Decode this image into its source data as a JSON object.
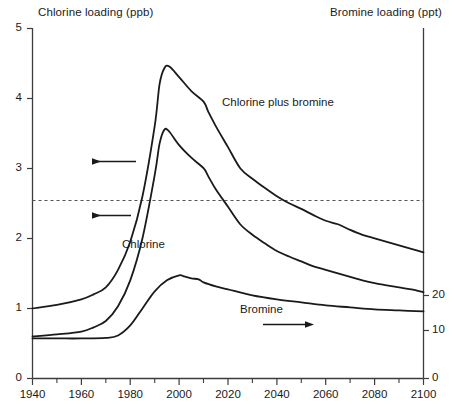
{
  "chart_data": {
    "type": "line",
    "title": "",
    "xlabel": "",
    "ylabel": "Chlorine loading (ppb)",
    "ylabel_right": "Bromine loading (ppt)",
    "xlim": [
      1940,
      2100
    ],
    "ylim": [
      0,
      5
    ],
    "ylim_right": [
      0,
      35
    ],
    "grid": false,
    "legend_position": "inline-annotations",
    "x_ticks": [
      1940,
      1960,
      1980,
      2000,
      2020,
      2040,
      2060,
      2080,
      2100
    ],
    "x_minor_ticks": [
      1950,
      1970,
      1990,
      2010,
      2030,
      2050,
      2070,
      2090
    ],
    "y_ticks_left": [
      0,
      1,
      2,
      3,
      4,
      5
    ],
    "y_ticks_right": [
      0,
      10,
      20
    ],
    "reference_line": {
      "label": "",
      "value": 2.47,
      "style": "dashed",
      "axis": "left"
    },
    "series": [
      {
        "name": "Chlorine plus bromine",
        "axis": "left",
        "units": "ppb",
        "x": [
          1940,
          1950,
          1960,
          1965,
          1970,
          1975,
          1980,
          1985,
          1990,
          1992,
          1994,
          1996,
          2000,
          2005,
          2010,
          2012,
          2015,
          2020,
          2025,
          2030,
          2035,
          2040,
          2045,
          2050,
          2055,
          2060,
          2065,
          2070,
          2075,
          2080,
          2085,
          2090,
          2095,
          2100
        ],
        "y": [
          1.0,
          1.05,
          1.13,
          1.2,
          1.3,
          1.55,
          1.95,
          2.6,
          3.6,
          4.2,
          4.43,
          4.45,
          4.3,
          4.1,
          3.95,
          3.8,
          3.6,
          3.3,
          3.0,
          2.85,
          2.72,
          2.6,
          2.5,
          2.42,
          2.33,
          2.25,
          2.2,
          2.12,
          2.05,
          2.0,
          1.95,
          1.9,
          1.85,
          1.8
        ]
      },
      {
        "name": "Chlorine",
        "axis": "left",
        "units": "ppb",
        "x": [
          1940,
          1950,
          1960,
          1965,
          1970,
          1975,
          1980,
          1985,
          1990,
          1992,
          1994,
          1996,
          2000,
          2005,
          2010,
          2012,
          2015,
          2020,
          2025,
          2030,
          2035,
          2040,
          2045,
          2050,
          2055,
          2060,
          2065,
          2070,
          2075,
          2080,
          2085,
          2090,
          2095,
          2100
        ],
        "y": [
          0.6,
          0.63,
          0.67,
          0.73,
          0.82,
          1.03,
          1.4,
          2.0,
          2.9,
          3.35,
          3.55,
          3.52,
          3.33,
          3.15,
          3.0,
          2.88,
          2.7,
          2.45,
          2.2,
          2.05,
          1.93,
          1.82,
          1.74,
          1.67,
          1.6,
          1.55,
          1.5,
          1.45,
          1.4,
          1.36,
          1.33,
          1.3,
          1.27,
          1.23
        ]
      },
      {
        "name": "Bromine",
        "axis": "right",
        "units": "ppt",
        "x": [
          1940,
          1950,
          1960,
          1970,
          1975,
          1980,
          1985,
          1990,
          1995,
          2000,
          2002,
          2005,
          2008,
          2010,
          2015,
          2020,
          2030,
          2040,
          2050,
          2060,
          2070,
          2080,
          2090,
          2100
        ],
        "y": [
          4.0,
          4.0,
          4.0,
          4.05,
          4.3,
          5.3,
          7.0,
          8.7,
          9.8,
          10.3,
          10.2,
          10.0,
          9.9,
          9.6,
          9.2,
          8.9,
          8.3,
          7.9,
          7.6,
          7.3,
          7.1,
          6.9,
          6.8,
          6.7
        ]
      }
    ],
    "annotations": [
      {
        "name": "arrow-upper-to-left-axis",
        "text": "",
        "icon": "arrow-left"
      },
      {
        "name": "arrow-lower-to-left-axis",
        "text": "",
        "icon": "arrow-left"
      },
      {
        "name": "arrow-bromine-to-right-axis",
        "text": "",
        "icon": "arrow-right"
      }
    ]
  },
  "axes": {
    "left_title": "Chlorine loading (ppb)",
    "right_title": "Bromine loading (ppt)",
    "left_ticks": [
      "5",
      "4",
      "3",
      "2",
      "1",
      "0"
    ],
    "right_ticks": [
      "20",
      "10",
      "0"
    ],
    "x_ticks": [
      "1940",
      "1960",
      "1980",
      "2000",
      "2020",
      "2040",
      "2060",
      "2080",
      "2100"
    ]
  },
  "labels": {
    "chlorine_plus_bromine": "Chlorine plus bromine",
    "chlorine": "Chlorine",
    "bromine": "Bromine"
  },
  "colors": {
    "line": "#1a1a1a",
    "axis": "#3c3c3c",
    "dashed": "#555555",
    "background": "#ffffff"
  }
}
